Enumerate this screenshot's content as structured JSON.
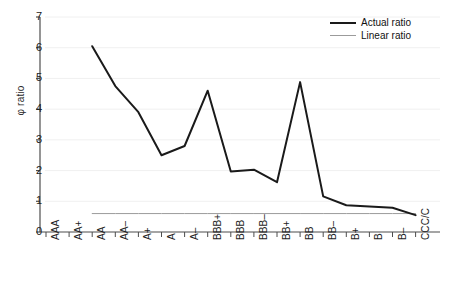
{
  "chart_data": {
    "type": "line",
    "title": "",
    "subtitle": "",
    "xlabel": "",
    "ylabel": "φ ratio",
    "ylim": [
      0,
      7
    ],
    "yticks": [
      0,
      1,
      2,
      3,
      4,
      5,
      6,
      7
    ],
    "ytick_labels": [
      "0",
      "1",
      "2",
      "3",
      "4",
      "5",
      "6",
      "7"
    ],
    "grid": true,
    "grid_axis": "y",
    "legend_position": "top-right",
    "categories": [
      "AAA",
      "AA+",
      "AA",
      "AA–",
      "A+",
      "A",
      "A–",
      "BBB+",
      "BBB",
      "BBB–",
      "BB+",
      "BB",
      "BB–",
      "B+",
      "B",
      "B–",
      "CCC/C"
    ],
    "series": [
      {
        "name": "Actual ratio",
        "color": "#1a1a1a",
        "line_width": 2,
        "values": [
          null,
          null,
          6.05,
          4.75,
          3.9,
          2.5,
          2.8,
          4.6,
          1.97,
          2.03,
          1.62,
          4.88,
          1.16,
          0.87,
          0.83,
          0.79,
          0.55
        ]
      },
      {
        "name": "Linear ratio",
        "color": "#9b9b9b",
        "line_width": 1,
        "values": [
          null,
          null,
          0.6,
          0.6,
          0.6,
          0.6,
          0.6,
          0.6,
          0.6,
          0.6,
          0.6,
          0.6,
          0.6,
          0.6,
          0.6,
          0.6,
          0.6
        ]
      }
    ]
  },
  "axes": {
    "y_title": "φ ratio",
    "y_tick_labels": [
      "7",
      "6",
      "5",
      "4",
      "3",
      "2",
      "1",
      "0"
    ],
    "x_tick_labels": [
      "AAA",
      "AA+",
      "AA",
      "AA–",
      "A+",
      "A",
      "A–",
      "BBB+",
      "BBB",
      "BBB–",
      "BB+",
      "BB",
      "BB–",
      "B+",
      "B",
      "B–",
      "CCC/C"
    ]
  },
  "legend": {
    "items": [
      {
        "label": "Actual ratio",
        "color": "#1a1a1a"
      },
      {
        "label": "Linear ratio",
        "color": "#9b9b9b"
      }
    ]
  },
  "colors": {
    "actual": "#1a1a1a",
    "linear": "#9b9b9b",
    "axis": "#4d4d4d",
    "grid": "#f0f0f0",
    "background": "#ffffff",
    "text": "#1e1e1e"
  }
}
